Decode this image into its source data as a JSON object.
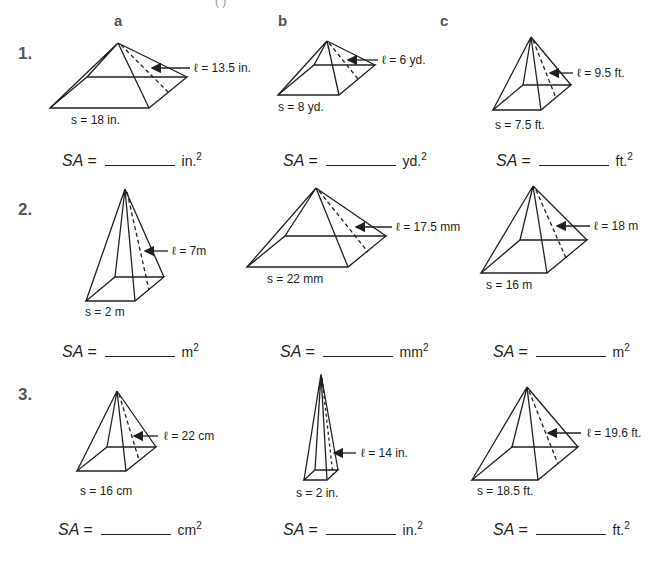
{
  "header": {
    "cut_text": "(     )",
    "columns": [
      "a",
      "b",
      "c"
    ]
  },
  "rows": [
    {
      "number": "1.",
      "problems": [
        {
          "col": "a",
          "slant_label": "ℓ = 13.5 in.",
          "side_label": "s = 18 in.",
          "sa_label": "SA =",
          "unit": "in.",
          "exp": "2"
        },
        {
          "col": "b",
          "slant_label": "ℓ = 6 yd.",
          "side_label": "s = 8 yd.",
          "sa_label": "SA =",
          "unit": "yd.",
          "exp": "2"
        },
        {
          "col": "c",
          "slant_label": "ℓ = 9.5 ft.",
          "side_label": "s = 7.5 ft.",
          "sa_label": "SA =",
          "unit": "ft.",
          "exp": "2"
        }
      ]
    },
    {
      "number": "2.",
      "problems": [
        {
          "col": "a",
          "slant_label": "ℓ = 7m",
          "side_label": "s = 2 m",
          "sa_label": "SA =",
          "unit": "m",
          "exp": "2"
        },
        {
          "col": "b",
          "slant_label": "ℓ = 17.5 mm",
          "side_label": "s = 22 mm",
          "sa_label": "SA =",
          "unit": "mm",
          "exp": "2"
        },
        {
          "col": "c",
          "slant_label": "ℓ = 18 m",
          "side_label": "s = 16 m",
          "sa_label": "SA =",
          "unit": "m",
          "exp": "2"
        }
      ]
    },
    {
      "number": "3.",
      "problems": [
        {
          "col": "a",
          "slant_label": "ℓ = 22 cm",
          "side_label": "s = 16 cm",
          "sa_label": "SA =",
          "unit": "cm",
          "exp": "2"
        },
        {
          "col": "b",
          "slant_label": "ℓ = 14 in.",
          "side_label": "s = 2 in.",
          "sa_label": "SA =",
          "unit": "in.",
          "exp": "2"
        },
        {
          "col": "c",
          "slant_label": "ℓ = 19.6 ft.",
          "side_label": "s = 18.5 ft.",
          "sa_label": "SA =",
          "unit": "ft.",
          "exp": "2"
        }
      ]
    }
  ]
}
